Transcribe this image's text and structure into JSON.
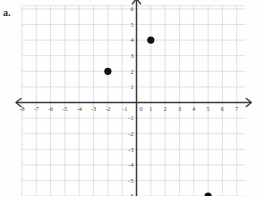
{
  "figure": {
    "problem_label": "a.",
    "axis_color": "#3a3a3a",
    "grid_color": "#d9d9d9",
    "point_color": "#111111",
    "label_color": "#4a4a4a"
  },
  "chart_data": {
    "type": "scatter",
    "title": "",
    "xlabel": "",
    "ylabel": "",
    "xlim": [
      -8,
      7.5
    ],
    "ylim": [
      -6,
      6
    ],
    "grid": true,
    "legend": null,
    "x_ticks": [
      -8,
      -7,
      -6,
      -5,
      -4,
      -3,
      -2,
      -1,
      0,
      1,
      2,
      3,
      4,
      5,
      6,
      7
    ],
    "x_tick_labels": [
      "-8",
      "-7",
      "-6",
      "-5",
      "-4",
      "-3",
      "-2",
      "-1",
      "0",
      "1",
      "2",
      "3",
      "4",
      "5",
      "6",
      "7"
    ],
    "y_ticks": [
      6,
      5,
      4,
      3,
      2,
      1,
      -1,
      -2,
      -3,
      -4,
      -5,
      -6
    ],
    "y_tick_labels": [
      "6",
      "5",
      "4",
      "3",
      "2",
      "1",
      "-1",
      "-2",
      "-3",
      "-4",
      "-5",
      "-6"
    ],
    "points": [
      {
        "x": 1,
        "y": 4,
        "label": ""
      },
      {
        "x": -2,
        "y": 2,
        "label": ""
      },
      {
        "x": 5,
        "y": -6,
        "label": ""
      }
    ],
    "axis_arrows": [
      "left",
      "right",
      "up",
      "down"
    ]
  }
}
